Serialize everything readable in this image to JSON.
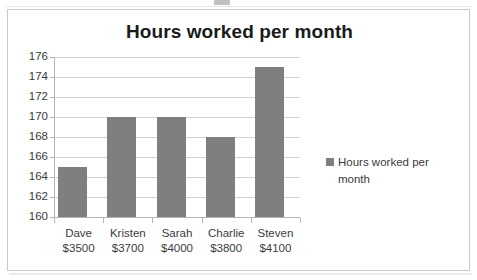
{
  "chart_data": {
    "type": "bar",
    "title": "Hours worked per month",
    "xlabel": "",
    "ylabel": "",
    "categories": [
      "Dave",
      "Kristen",
      "Sarah",
      "Charlie",
      "Steven"
    ],
    "category_sublabels": [
      "$3500",
      "$3700",
      "$4000",
      "$3800",
      "$4100"
    ],
    "values": [
      165,
      170,
      170,
      168,
      175
    ],
    "ylim": [
      160,
      176
    ],
    "ytick_step": 2,
    "yticks": [
      176,
      174,
      172,
      170,
      168,
      166,
      164,
      162,
      160
    ],
    "grid": true,
    "legend": {
      "position": "right",
      "entries": [
        {
          "name": "Hours worked per month",
          "color": "#7f7f7f"
        }
      ]
    },
    "series": [
      {
        "name": "Hours worked per month",
        "color": "#7f7f7f",
        "values": [
          165,
          170,
          170,
          168,
          175
        ]
      }
    ]
  },
  "colors": {
    "bar": "#7f7f7f",
    "gridline": "#d2d2d2",
    "axis": "#b4b4b4",
    "frame_border": "#c9c9c9",
    "title_text": "#1b1b1b",
    "label_text": "#3b3b3b",
    "background": "#ffffff"
  },
  "legend_label": "Hours worked per month"
}
